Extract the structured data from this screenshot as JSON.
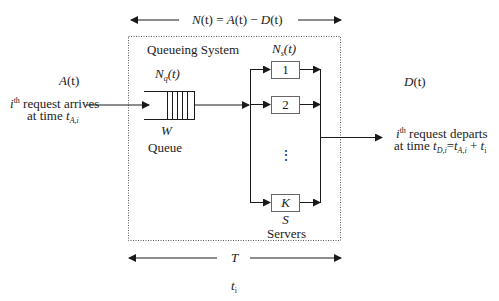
{
  "diagram": {
    "top_span": {
      "label_N": "N",
      "label_rest": "(t) = ",
      "A": "A",
      "A_t": "(t) − ",
      "D": "D",
      "D_t": "(t)"
    },
    "system": {
      "title": "Queueing System"
    },
    "arrivals": {
      "label_A": "A",
      "label_A_t": "(t)",
      "line1_i": "i",
      "line1_sup": "th",
      "line1_rest": " request arrives",
      "line2_prefix": "at time ",
      "line2_t": "t",
      "line2_sub": "A,i"
    },
    "queue": {
      "label_N": "N",
      "label_sub": "q",
      "label_t": "(t)",
      "W": "W",
      "name": "Queue"
    },
    "servers": {
      "label_N": "N",
      "label_sub": "s",
      "label_t": "(t)",
      "boxes": [
        "1",
        "2",
        "K"
      ],
      "ellipsis": "⋮",
      "S": "S",
      "name": "Servers"
    },
    "departures": {
      "label_D": "D",
      "label_D_t": "(t)",
      "line1_i": "i",
      "line1_sup": "th",
      "line1_rest": " request departs",
      "line2_prefix": "at time ",
      "line2_t1": "t",
      "line2_sub1": "D,i",
      "line2_eq": "=",
      "line2_t2": "t",
      "line2_sub2": "A,i",
      "line2_plus": " + ",
      "line2_t3": "t",
      "line2_sub3": "i"
    },
    "bottom_span": {
      "T": "T",
      "t_i": "t",
      "t_i_sub": "i"
    },
    "colors": {
      "line": "#1a1a1a",
      "dotted_border": "#555555",
      "background": "#ffffff"
    }
  }
}
